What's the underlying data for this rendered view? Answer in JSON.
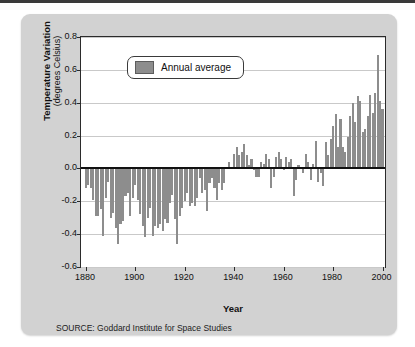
{
  "figure": {
    "source_note": "SOURCE: Goddard Institute for Space Studies",
    "panel_color": "#d2d2d2",
    "bar_color": "#8d8d8d",
    "plot_background": "#ffffff",
    "axis_color": "#2b2b2b",
    "gridline_color": "#c9c9c9"
  },
  "chart_data": {
    "type": "bar",
    "title": "",
    "xlabel": "Year",
    "ylabel": "Temperature Variation (degrees Celsius)",
    "ylabel_line1": "Temperature Variation",
    "ylabel_line2": "(degrees Celsius)",
    "xlim": [
      1878,
      2001
    ],
    "ylim": [
      -0.6,
      0.8
    ],
    "yticks": [
      0.8,
      0.6,
      0.4,
      0.2,
      0.0,
      -0.2,
      -0.4,
      -0.6
    ],
    "ytick_labels": [
      "0.8",
      "0.6",
      "0.4",
      "0.2",
      "0.0",
      "-0.2",
      "-0.4",
      "-0.6"
    ],
    "xticks": [
      1880,
      1900,
      1920,
      1940,
      1960,
      1980,
      2000
    ],
    "xtick_labels": [
      "1880",
      "1900",
      "1920",
      "1940",
      "1960",
      "1980",
      "2000"
    ],
    "grid": true,
    "grid_axis": "y",
    "zero_line": true,
    "legend": {
      "position": "upper-left-inside",
      "entries": [
        {
          "label": "Annual average",
          "color": "#8d8d8d"
        }
      ]
    },
    "series": [
      {
        "name": "Annual average",
        "color": "#8d8d8d",
        "x": [
          1880,
          1881,
          1882,
          1883,
          1884,
          1885,
          1886,
          1887,
          1888,
          1889,
          1890,
          1891,
          1892,
          1893,
          1894,
          1895,
          1896,
          1897,
          1898,
          1899,
          1900,
          1901,
          1902,
          1903,
          1904,
          1905,
          1906,
          1907,
          1908,
          1909,
          1910,
          1911,
          1912,
          1913,
          1914,
          1915,
          1916,
          1917,
          1918,
          1919,
          1920,
          1921,
          1922,
          1923,
          1924,
          1925,
          1926,
          1927,
          1928,
          1929,
          1930,
          1931,
          1932,
          1933,
          1934,
          1935,
          1936,
          1937,
          1938,
          1939,
          1940,
          1941,
          1942,
          1943,
          1944,
          1945,
          1946,
          1947,
          1948,
          1949,
          1950,
          1951,
          1952,
          1953,
          1954,
          1955,
          1956,
          1957,
          1958,
          1959,
          1960,
          1961,
          1962,
          1963,
          1964,
          1965,
          1966,
          1967,
          1968,
          1969,
          1970,
          1971,
          1972,
          1973,
          1974,
          1975,
          1976,
          1977,
          1978,
          1979,
          1980,
          1981,
          1982,
          1983,
          1984,
          1985,
          1986,
          1987,
          1988,
          1989,
          1990,
          1991,
          1992,
          1993,
          1994,
          1995,
          1996,
          1997,
          1998,
          1999,
          2000
        ],
        "values": [
          -0.12,
          -0.1,
          -0.12,
          -0.19,
          -0.29,
          -0.29,
          -0.25,
          -0.41,
          -0.18,
          -0.08,
          -0.3,
          -0.27,
          -0.36,
          -0.46,
          -0.34,
          -0.32,
          -0.17,
          -0.15,
          -0.29,
          -0.18,
          -0.1,
          -0.19,
          -0.28,
          -0.35,
          -0.42,
          -0.3,
          -0.24,
          -0.41,
          -0.35,
          -0.36,
          -0.34,
          -0.38,
          -0.31,
          -0.33,
          -0.21,
          -0.16,
          -0.31,
          -0.46,
          -0.29,
          -0.24,
          -0.2,
          -0.15,
          -0.23,
          -0.21,
          -0.23,
          -0.18,
          -0.06,
          -0.15,
          -0.13,
          -0.26,
          -0.09,
          -0.06,
          -0.12,
          -0.19,
          -0.09,
          -0.13,
          -0.09,
          0.0,
          0.04,
          0.0,
          0.09,
          0.13,
          0.08,
          0.1,
          0.15,
          0.08,
          0.02,
          0.06,
          -0.01,
          -0.05,
          -0.05,
          0.04,
          0.03,
          0.09,
          0.06,
          -0.12,
          -0.05,
          0.07,
          0.1,
          0.06,
          -0.01,
          0.07,
          0.04,
          0.06,
          -0.17,
          -0.07,
          0.02,
          0.01,
          -0.03,
          0.09,
          0.04,
          -0.07,
          0.03,
          0.17,
          -0.08,
          -0.03,
          -0.11,
          0.16,
          0.08,
          0.18,
          0.26,
          0.33,
          0.13,
          0.3,
          0.13,
          0.1,
          0.19,
          0.32,
          0.4,
          0.28,
          0.44,
          0.41,
          0.22,
          0.24,
          0.32,
          0.45,
          0.34,
          0.46,
          0.69,
          0.41,
          0.36
        ]
      }
    ]
  }
}
